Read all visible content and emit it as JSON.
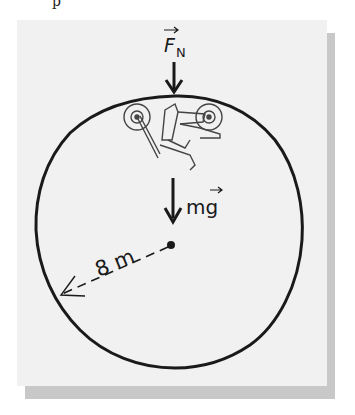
{
  "figure": {
    "top_text_fragment": "p",
    "labels": {
      "normal_force": "F",
      "normal_force_subscript": "N",
      "weight": "mg",
      "radius": "8 m"
    },
    "elements": {
      "loop": "circular loop track",
      "vehicle": "motorcycle with rider at top of loop (upside down)",
      "center": "center point",
      "radius_arrow": "dashed radius arrow from center to loop"
    },
    "colors": {
      "background": "#ffffff",
      "panel": "#f1f1f1",
      "shadow": "#c8c8c8",
      "ink": "#1a1a1a"
    }
  }
}
